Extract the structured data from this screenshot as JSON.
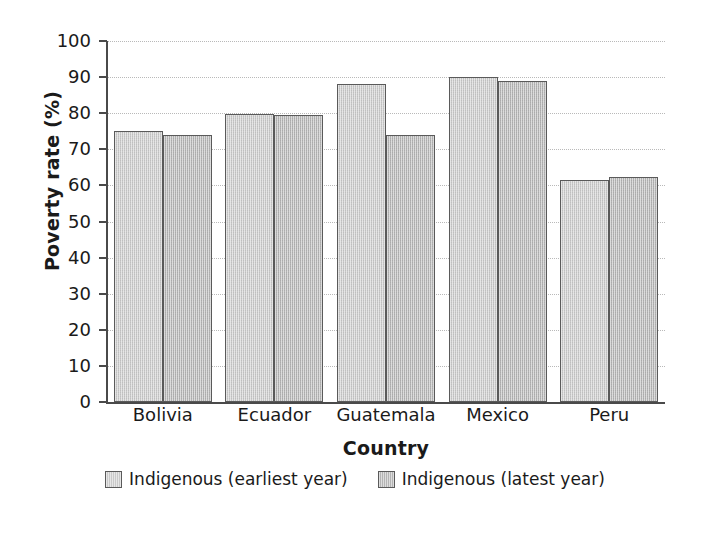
{
  "chart_data": {
    "type": "bar",
    "title": "",
    "xlabel": "Country",
    "ylabel": "Poverty rate (%)",
    "categories": [
      "Bolivia",
      "Ecuador",
      "Guatemala",
      "Mexico",
      "Peru"
    ],
    "series": [
      {
        "name": "Indigenous (earliest year)",
        "color": "#c9c9c9",
        "values": [
          75,
          79.8,
          88,
          90,
          61.5
        ]
      },
      {
        "name": "Indigenous (latest year)",
        "color": "#b4b4b4",
        "values": [
          74,
          79.6,
          74,
          89,
          62.3
        ]
      }
    ],
    "ylim": [
      0,
      100
    ],
    "yticks": [
      0,
      10,
      20,
      30,
      40,
      50,
      60,
      70,
      80,
      90,
      100
    ],
    "ytick_labels": [
      "0",
      "10",
      "20",
      "30",
      "40",
      "50",
      "60",
      "70",
      "80",
      "90",
      "100"
    ],
    "grid": "horizontal-dotted",
    "legend_position": "bottom-center",
    "axis_color": "#4a4a4a",
    "grid_color": "#b9b9b9",
    "bar_edge_color": "#5a5a5a",
    "background_color": "#ffffff"
  }
}
